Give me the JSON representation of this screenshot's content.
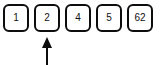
{
  "diagram": {
    "type": "array-cells-with-pointer",
    "background_color": "#ffffff",
    "stroke_color": "#0d0d0d",
    "text_color": "#111111",
    "cells": [
      {
        "value": "1"
      },
      {
        "value": "2"
      },
      {
        "value": "4"
      },
      {
        "value": "5"
      },
      {
        "value": "62"
      }
    ],
    "pointer": {
      "icon_name": "up-arrow-icon",
      "direction": "up",
      "points_to_cell_index": 1,
      "points_to_value": "2",
      "color": "#0d0d0d"
    }
  }
}
